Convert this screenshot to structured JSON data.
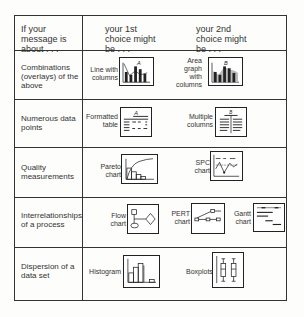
{
  "header": {
    "col1": "If your message is about . . .",
    "col2": "your 1st choice might be . . .",
    "col3": "your 2nd choice might be . . ."
  },
  "rows": [
    {
      "topic": "Combinations (overlays) of the above",
      "choices": [
        {
          "caption": "Line with columns",
          "icon": "line-with-columns-icon",
          "letter": "A"
        },
        {
          "caption": "Area graph with columns",
          "icon": "area-graph-with-columns-icon",
          "letter": "B"
        }
      ]
    },
    {
      "topic": "Numerous data points",
      "choices": [
        {
          "caption": "Formatted table",
          "icon": "formatted-table-icon",
          "letter": "A"
        },
        {
          "caption": "Multiple columns",
          "icon": "multiple-columns-icon",
          "letter": "B"
        }
      ]
    },
    {
      "topic": "Quality measurements",
      "choices": [
        {
          "caption": "Pareto chart",
          "icon": "pareto-chart-icon"
        },
        {
          "caption": "SPC chart",
          "icon": "spc-chart-icon"
        }
      ]
    },
    {
      "topic": "Interrelationships of a process",
      "choices": [
        {
          "caption": "Flow chart",
          "icon": "flow-chart-icon"
        },
        {
          "caption": "PERT chart",
          "icon": "pert-chart-icon"
        },
        {
          "caption": "Gantt chart",
          "icon": "gantt-chart-icon"
        }
      ]
    },
    {
      "topic": "Dispersion of a data set",
      "choices": [
        {
          "caption": "Histogram",
          "icon": "histogram-icon"
        },
        {
          "caption": "Boxplots",
          "icon": "boxplots-icon"
        }
      ]
    }
  ]
}
